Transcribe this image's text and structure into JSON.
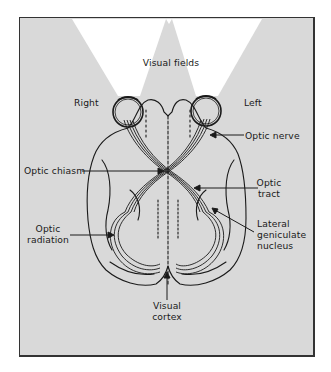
{
  "diagram": {
    "title": "Visual fields",
    "colors": {
      "background": "#d9d9d9",
      "frame": "#333333",
      "visual_field_beam": "#ffffff",
      "line": "#1a1a1a"
    },
    "labels": {
      "visual_fields": "Visual fields",
      "right": "Right",
      "left": "Left",
      "optic_nerve": "Optic nerve",
      "optic_chiasm": "Optic chiasm",
      "optic_tract_line1": "Optic",
      "optic_tract_line2": "tract",
      "lgn_line1": "Lateral",
      "lgn_line2": "geniculate",
      "lgn_line3": "nucleus",
      "optic_radiation_line1": "Optic",
      "optic_radiation_line2": "radiation",
      "visual_cortex_line1": "Visual",
      "visual_cortex_line2": "cortex"
    }
  }
}
